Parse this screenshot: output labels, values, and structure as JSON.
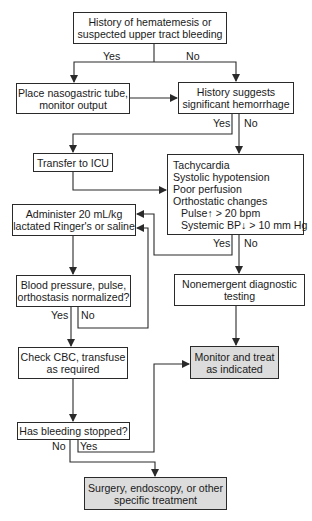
{
  "diagram": {
    "type": "flowchart",
    "colors": {
      "line": "#2a2a2a",
      "box_fill": "#ffffff",
      "terminal_fill": "#dcdcdc"
    },
    "nodes": {
      "start": {
        "lines": [
          "History of hematemesis or",
          "suspected upper tract bleeding"
        ]
      },
      "ng_tube": {
        "lines": [
          "Place nasogastric tube,",
          "monitor output"
        ]
      },
      "history_hemorrhage": {
        "lines": [
          "History suggests",
          "significant hemorrhage"
        ]
      },
      "icu": {
        "lines": [
          "Transfer to ICU"
        ]
      },
      "signs": {
        "lines": [
          "Tachycardia",
          "Systolic hypotension",
          "Poor perfusion",
          "Orthostatic changes",
          "Pulse↑ > 20 bpm",
          "Systemic BP↓ > 10 mm Hg"
        ]
      },
      "administer": {
        "lines": [
          "Administer 20 mL/kg",
          "lactated Ringer's or saline"
        ]
      },
      "normalized": {
        "lines": [
          "Blood pressure, pulse,",
          "orthostasis normalized?"
        ]
      },
      "nonemergent": {
        "lines": [
          "Nonemergent diagnostic",
          "testing"
        ]
      },
      "check_cbc": {
        "lines": [
          "Check CBC, transfuse",
          "as required"
        ]
      },
      "monitor": {
        "lines": [
          "Monitor and treat",
          "as indicated"
        ]
      },
      "bleeding_stopped": {
        "lines": [
          "Has bleeding stopped?"
        ]
      },
      "surgery": {
        "lines": [
          "Surgery, endoscopy, or other",
          "specific treatment"
        ]
      }
    },
    "edge_labels": {
      "start_yes": "Yes",
      "start_no": "No",
      "hemorrhage_yes": "Yes",
      "hemorrhage_no": "No",
      "signs_yes": "Yes",
      "signs_no": "No",
      "normalized_yes": "Yes",
      "normalized_no": "No",
      "bleeding_no": "No",
      "bleeding_yes": "Yes"
    },
    "edges": [
      {
        "from": "start",
        "to": "ng_tube",
        "label": "Yes"
      },
      {
        "from": "start",
        "to": "history_hemorrhage",
        "label": "No"
      },
      {
        "from": "ng_tube",
        "to": "history_hemorrhage"
      },
      {
        "from": "history_hemorrhage",
        "to": "icu",
        "label": "Yes"
      },
      {
        "from": "history_hemorrhage",
        "to": "signs",
        "label": "No"
      },
      {
        "from": "icu",
        "to": "signs"
      },
      {
        "from": "signs",
        "to": "administer",
        "label": "Yes"
      },
      {
        "from": "signs",
        "to": "nonemergent",
        "label": "No"
      },
      {
        "from": "administer",
        "to": "normalized"
      },
      {
        "from": "normalized",
        "to": "check_cbc",
        "label": "Yes"
      },
      {
        "from": "normalized",
        "to": "administer",
        "label": "No"
      },
      {
        "from": "nonemergent",
        "to": "monitor"
      },
      {
        "from": "check_cbc",
        "to": "bleeding_stopped"
      },
      {
        "from": "bleeding_stopped",
        "to": "surgery",
        "label": "No"
      },
      {
        "from": "bleeding_stopped",
        "to": "monitor",
        "label": "Yes"
      }
    ]
  }
}
